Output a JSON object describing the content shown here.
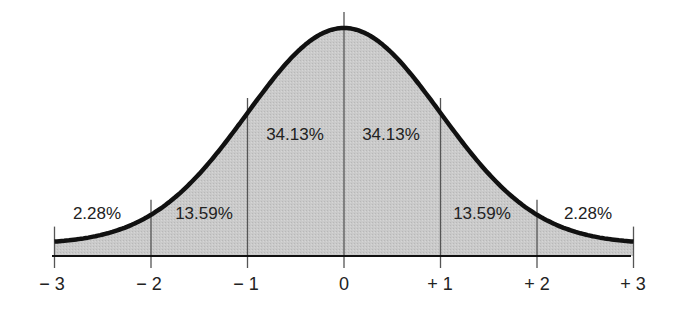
{
  "chart_data": {
    "type": "area",
    "title": "",
    "xlabel": "",
    "ylabel": "",
    "x_ticks": [
      "− 3",
      "− 2",
      "− 1",
      "0",
      "+ 1",
      "+ 2",
      "+ 3"
    ],
    "x_values": [
      -3,
      -2,
      -1,
      0,
      1,
      2,
      3
    ],
    "xlim": [
      -3,
      3
    ],
    "grid": false,
    "legend": null,
    "regions": [
      {
        "from": -3,
        "to": -2,
        "percent": 2.28,
        "label": "2.28%"
      },
      {
        "from": -2,
        "to": -1,
        "percent": 13.59,
        "label": "13.59%"
      },
      {
        "from": -1,
        "to": 0,
        "percent": 34.13,
        "label": "34.13%"
      },
      {
        "from": 0,
        "to": 1,
        "percent": 34.13,
        "label": "34.13%"
      },
      {
        "from": 1,
        "to": 2,
        "percent": 13.59,
        "label": "13.59%"
      },
      {
        "from": 2,
        "to": 3,
        "percent": 2.28,
        "label": "2.28%"
      }
    ],
    "colors": {
      "fill": "#c9c9c9",
      "curve": "#111111",
      "lines": "#555555",
      "axis": "#111111"
    }
  },
  "labels": {
    "r0": "2.28%",
    "r1": "13.59%",
    "r2": "34.13%",
    "r3": "34.13%",
    "r4": "13.59%",
    "r5": "2.28%"
  },
  "ticks": {
    "t0": "− 3",
    "t1": "− 2",
    "t2": "− 1",
    "t3": "0",
    "t4": "+ 1",
    "t5": "+ 2",
    "t6": "+ 3"
  }
}
